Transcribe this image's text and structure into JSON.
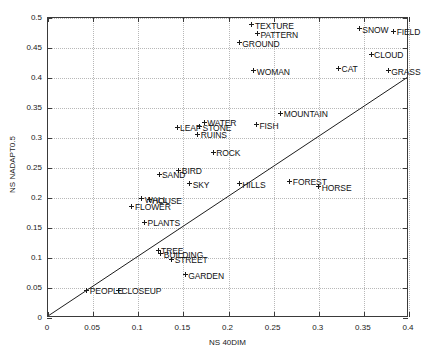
{
  "chart_data": {
    "type": "scatter",
    "title": "",
    "xlabel": "NS 40DIM",
    "ylabel": "NS NADAPT0.5",
    "xlim": [
      0,
      0.4
    ],
    "ylim": [
      0,
      0.5
    ],
    "xticks": [
      "0",
      "0.05",
      "0.1",
      "0.15",
      "0.2",
      "0.25",
      "0.3",
      "0.35",
      "0.4"
    ],
    "xtick_values": [
      0,
      0.05,
      0.1,
      0.15,
      0.2,
      0.25,
      0.3,
      0.35,
      0.4
    ],
    "yticks": [
      "0",
      "0.05",
      "0.1",
      "0.15",
      "0.2",
      "0.25",
      "0.3",
      "0.35",
      "0.4",
      "0.45",
      "0.5"
    ],
    "ytick_values": [
      0,
      0.05,
      0.1,
      0.15,
      0.2,
      0.25,
      0.3,
      0.35,
      0.4,
      0.45,
      0.5
    ],
    "grid": true,
    "legend": "none",
    "reference_line": {
      "name": "identity-line",
      "from": [
        0,
        0
      ],
      "to": [
        0.4,
        0.4
      ],
      "description": "y = x diagonal"
    },
    "marker": "plus",
    "points": [
      {
        "label": "TEXTURE",
        "x": 0.226,
        "y": 0.489,
        "label_dx": 3,
        "label_dy": -4
      },
      {
        "label": "PATTERN",
        "x": 0.232,
        "y": 0.474,
        "label_dx": 3,
        "label_dy": -4
      },
      {
        "label": "GROUND",
        "x": 0.212,
        "y": 0.459,
        "label_dx": 3,
        "label_dy": -4
      },
      {
        "label": "SNOW",
        "x": 0.345,
        "y": 0.482,
        "label_dx": 3,
        "label_dy": -4
      },
      {
        "label": "FIELD",
        "x": 0.383,
        "y": 0.478,
        "label_dx": 3,
        "label_dy": -4
      },
      {
        "label": "CLOUD",
        "x": 0.358,
        "y": 0.44,
        "label_dx": 3,
        "label_dy": -4
      },
      {
        "label": "CAT",
        "x": 0.322,
        "y": 0.416,
        "label_dx": 3,
        "label_dy": -4
      },
      {
        "label": "GRASS",
        "x": 0.377,
        "y": 0.412,
        "label_dx": 3,
        "label_dy": -4
      },
      {
        "label": "WOMAN",
        "x": 0.228,
        "y": 0.412,
        "label_dx": 3,
        "label_dy": -4
      },
      {
        "label": "MOUNTAIN",
        "x": 0.258,
        "y": 0.341,
        "label_dx": 3,
        "label_dy": -4
      },
      {
        "label": "FISH",
        "x": 0.231,
        "y": 0.322,
        "label_dx": 3,
        "label_dy": -4
      },
      {
        "label": "WATER",
        "x": 0.173,
        "y": 0.326,
        "label_dx": 3,
        "label_dy": -4
      },
      {
        "label": "STONE",
        "x": 0.168,
        "y": 0.319,
        "label_dx": 3,
        "label_dy": -4
      },
      {
        "label": "LEAF",
        "x": 0.143,
        "y": 0.318,
        "label_dx": 3,
        "label_dy": -4
      },
      {
        "label": "RUINS",
        "x": 0.166,
        "y": 0.306,
        "label_dx": 3,
        "label_dy": -4
      },
      {
        "label": "ROCK",
        "x": 0.183,
        "y": 0.276,
        "label_dx": 3,
        "label_dy": -4
      },
      {
        "label": "BIRD",
        "x": 0.145,
        "y": 0.246,
        "label_dx": 3,
        "label_dy": -4
      },
      {
        "label": "SAND",
        "x": 0.123,
        "y": 0.24,
        "label_dx": 3,
        "label_dy": -4
      },
      {
        "label": "SKY",
        "x": 0.157,
        "y": 0.224,
        "label_dx": 3,
        "label_dy": -4
      },
      {
        "label": "HILLS",
        "x": 0.212,
        "y": 0.224,
        "label_dx": 3,
        "label_dy": -4
      },
      {
        "label": "FOREST",
        "x": 0.268,
        "y": 0.228,
        "label_dx": 3,
        "label_dy": -4
      },
      {
        "label": "HORSE",
        "x": 0.3,
        "y": 0.219,
        "label_dx": 3,
        "label_dy": -4
      },
      {
        "label": "WALL",
        "x": 0.104,
        "y": 0.199,
        "label_dx": 3,
        "label_dy": -4
      },
      {
        "label": "HOUSE",
        "x": 0.112,
        "y": 0.197,
        "label_dx": 3,
        "label_dy": -4
      },
      {
        "label": "FLOWER",
        "x": 0.093,
        "y": 0.186,
        "label_dx": 3,
        "label_dy": -4
      },
      {
        "label": "PLANTS",
        "x": 0.107,
        "y": 0.16,
        "label_dx": 3,
        "label_dy": -4
      },
      {
        "label": "TREE",
        "x": 0.122,
        "y": 0.113,
        "label_dx": 3,
        "label_dy": -4
      },
      {
        "label": "BUILDING",
        "x": 0.125,
        "y": 0.107,
        "label_dx": 3,
        "label_dy": -4
      },
      {
        "label": "STREET",
        "x": 0.137,
        "y": 0.098,
        "label_dx": 3,
        "label_dy": -4
      },
      {
        "label": "GARDEN",
        "x": 0.152,
        "y": 0.072,
        "label_dx": 3,
        "label_dy": -4
      },
      {
        "label": "PEOPLE",
        "x": 0.043,
        "y": 0.046,
        "label_dx": 3,
        "label_dy": -4
      },
      {
        "label": "CLOSEUP",
        "x": 0.078,
        "y": 0.046,
        "label_dx": 3,
        "label_dy": -4
      }
    ]
  },
  "colors": {
    "axis": "#3a3a3a",
    "grid": "#b8b8b8",
    "text": "#111111",
    "marker": "#1a1a1a",
    "background": "#ffffff"
  }
}
